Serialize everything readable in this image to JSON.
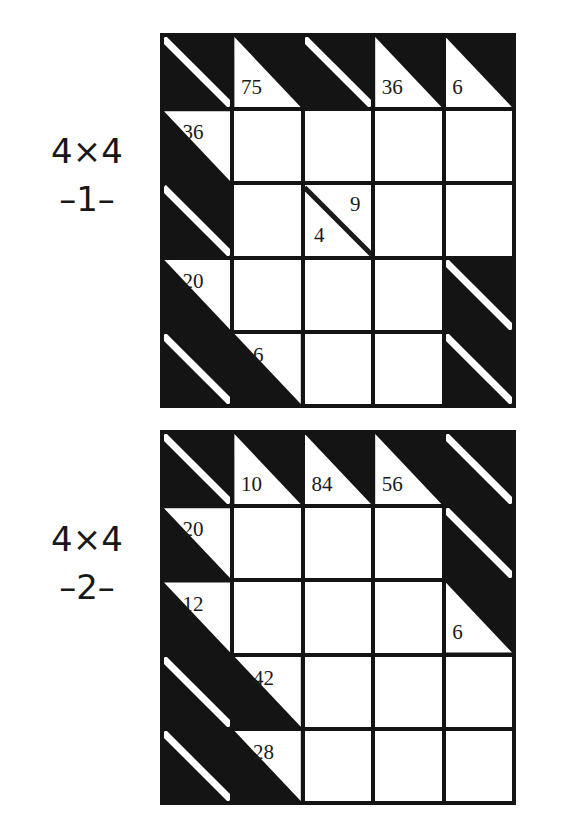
{
  "page": {
    "background_color": "#ffffff",
    "ink_color": "#141414",
    "cell_color": "#ffffff"
  },
  "puzzles": [
    {
      "id": "puzzle-1",
      "caption": {
        "size": "4×4",
        "index": "–1–"
      },
      "grid": {
        "rows": 5,
        "cols": 5,
        "cells": [
          [
            {
              "kind": "block"
            },
            {
              "kind": "clue",
              "across": "",
              "down": "75"
            },
            {
              "kind": "block"
            },
            {
              "kind": "clue",
              "across": "",
              "down": "36"
            },
            {
              "kind": "clue",
              "across": "",
              "down": "6"
            }
          ],
          [
            {
              "kind": "clue",
              "across": "36",
              "down": ""
            },
            {
              "kind": "entry"
            },
            {
              "kind": "entry"
            },
            {
              "kind": "entry"
            },
            {
              "kind": "entry"
            }
          ],
          [
            {
              "kind": "block"
            },
            {
              "kind": "entry"
            },
            {
              "kind": "split",
              "across": "4",
              "down": "9"
            },
            {
              "kind": "entry"
            },
            {
              "kind": "entry"
            }
          ],
          [
            {
              "kind": "clue",
              "across": "20",
              "down": ""
            },
            {
              "kind": "entry"
            },
            {
              "kind": "entry"
            },
            {
              "kind": "entry"
            },
            {
              "kind": "block"
            }
          ],
          [
            {
              "kind": "block"
            },
            {
              "kind": "clue",
              "across": "6",
              "down": ""
            },
            {
              "kind": "entry"
            },
            {
              "kind": "entry"
            },
            {
              "kind": "block"
            }
          ]
        ]
      }
    },
    {
      "id": "puzzle-2",
      "caption": {
        "size": "4×4",
        "index": "–2–"
      },
      "grid": {
        "rows": 5,
        "cols": 5,
        "cells": [
          [
            {
              "kind": "block"
            },
            {
              "kind": "clue",
              "across": "",
              "down": "10"
            },
            {
              "kind": "clue",
              "across": "",
              "down": "84"
            },
            {
              "kind": "clue",
              "across": "",
              "down": "56"
            },
            {
              "kind": "block"
            }
          ],
          [
            {
              "kind": "clue",
              "across": "20",
              "down": ""
            },
            {
              "kind": "entry"
            },
            {
              "kind": "entry"
            },
            {
              "kind": "entry"
            },
            {
              "kind": "block"
            }
          ],
          [
            {
              "kind": "clue",
              "across": "12",
              "down": ""
            },
            {
              "kind": "entry"
            },
            {
              "kind": "entry"
            },
            {
              "kind": "entry"
            },
            {
              "kind": "clue",
              "across": "",
              "down": "6"
            }
          ],
          [
            {
              "kind": "block"
            },
            {
              "kind": "clue",
              "across": "42",
              "down": ""
            },
            {
              "kind": "entry"
            },
            {
              "kind": "entry"
            },
            {
              "kind": "entry"
            }
          ],
          [
            {
              "kind": "block"
            },
            {
              "kind": "clue",
              "across": "28",
              "down": ""
            },
            {
              "kind": "entry"
            },
            {
              "kind": "entry"
            },
            {
              "kind": "entry"
            }
          ]
        ]
      }
    }
  ]
}
